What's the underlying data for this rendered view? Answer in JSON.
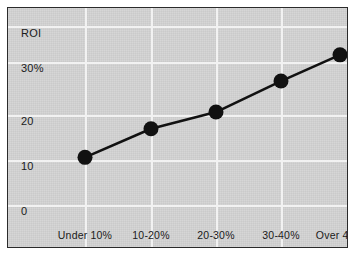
{
  "chart_data": {
    "type": "line",
    "title": "",
    "ylabel": "ROI",
    "xlabel": "",
    "grid": true,
    "legend": false,
    "ylim": [
      0,
      37
    ],
    "categories": [
      "Under 10%",
      "10-20%",
      "20-30%",
      "30-40%",
      "Over 40%"
    ],
    "values": [
      10,
      16,
      19.5,
      26,
      31.5
    ],
    "ytick_labels": [
      "ROI",
      "30%",
      "20",
      "10",
      "0"
    ],
    "ytick_values": [
      37,
      30,
      20,
      10,
      0
    ],
    "marker": "circle",
    "series": [
      {
        "name": "ROI",
        "values": [
          10,
          16,
          19.5,
          26,
          31.5
        ]
      }
    ],
    "colors": {
      "plot_background": "#d2d2d2",
      "gridline": "#f2f2f2",
      "line": "#111111",
      "marker": "#111111",
      "border": "#2b2b2b",
      "text": "#1a1a1a",
      "page_background": "#ffffff"
    }
  }
}
